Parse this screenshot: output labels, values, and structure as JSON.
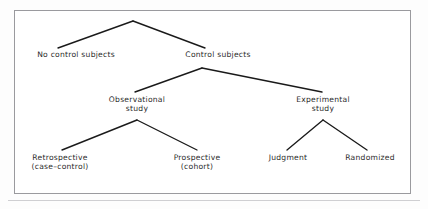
{
  "figure": {
    "type": "tree-diagram",
    "title": "",
    "frame": {
      "border_color": "#9a9a9e",
      "background": "#ffffff"
    },
    "line_color": "#1a1a1a",
    "text_color": "#2b2b2b"
  },
  "tree": {
    "root": {
      "x": 133,
      "y": 21
    },
    "nodes": [
      {
        "id": "no-control-subjects",
        "label_line1": "No control subjects",
        "label_line2": "",
        "level": 1,
        "x": 76,
        "label_y": 50,
        "anchor_x": 58,
        "anchor_y": 48
      },
      {
        "id": "control-subjects",
        "label_line1": "Control subjects",
        "label_line2": "",
        "level": 1,
        "x": 218,
        "label_y": 50,
        "anchor_x": 205,
        "anchor_y": 48
      },
      {
        "id": "observational-study",
        "label_line1": "Observational",
        "label_line2": "study",
        "level": 2,
        "x": 137,
        "label_y": 95,
        "anchor_x": 135,
        "anchor_y": 92
      },
      {
        "id": "experimental-study",
        "label_line1": "Experimental",
        "label_line2": "study",
        "level": 2,
        "x": 323,
        "label_y": 95,
        "anchor_x": 322,
        "anchor_y": 92
      },
      {
        "id": "retrospective-case-control",
        "label_line1": "Retrospective",
        "label_line2": "(case–control)",
        "level": 3,
        "x": 60,
        "label_y": 153,
        "anchor_x": 62,
        "anchor_y": 150
      },
      {
        "id": "prospective-cohort",
        "label_line1": "Prospective",
        "label_line2": "(cohort)",
        "level": 3,
        "x": 197,
        "label_y": 153,
        "anchor_x": 197,
        "anchor_y": 150
      },
      {
        "id": "judgment",
        "label_line1": "Judgment",
        "label_line2": "",
        "level": 3,
        "x": 288,
        "label_y": 153,
        "anchor_x": 287,
        "anchor_y": 150
      },
      {
        "id": "randomized",
        "label_line1": "Randomized",
        "label_line2": "",
        "level": 3,
        "x": 370,
        "label_y": 153,
        "anchor_x": 367,
        "anchor_y": 150
      }
    ],
    "branches": [
      {
        "from": "root",
        "to": "no-control-subjects",
        "x1": 133,
        "y1": 21,
        "x2": 58,
        "y2": 48
      },
      {
        "from": "root",
        "to": "control-subjects",
        "x1": 133,
        "y1": 21,
        "x2": 205,
        "y2": 48
      },
      {
        "from": "control-subjects",
        "to": "observational-study",
        "x1": 202,
        "y1": 68,
        "x2": 135,
        "y2": 92
      },
      {
        "from": "control-subjects",
        "to": "experimental-study",
        "x1": 202,
        "y1": 68,
        "x2": 322,
        "y2": 92
      },
      {
        "from": "observational-study",
        "to": "retrospective-case-control",
        "x1": 137,
        "y1": 120,
        "x2": 62,
        "y2": 150
      },
      {
        "from": "observational-study",
        "to": "prospective-cohort",
        "x1": 137,
        "y1": 120,
        "x2": 197,
        "y2": 150
      },
      {
        "from": "experimental-study",
        "to": "judgment",
        "x1": 323,
        "y1": 120,
        "x2": 287,
        "y2": 150
      },
      {
        "from": "experimental-study",
        "to": "randomized",
        "x1": 323,
        "y1": 120,
        "x2": 367,
        "y2": 150
      }
    ]
  }
}
